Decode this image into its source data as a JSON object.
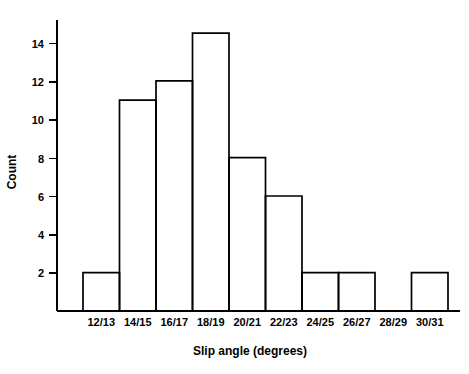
{
  "chart_data": {
    "type": "bar",
    "title": "",
    "xlabel": "Slip angle (degrees)",
    "ylabel": "Count",
    "categories": [
      "12/13",
      "14/15",
      "16/17",
      "18/19",
      "20/21",
      "22/23",
      "24/25",
      "26/27",
      "28/29",
      "30/31"
    ],
    "values": [
      2,
      11,
      12,
      14.5,
      8,
      6,
      2,
      2,
      0,
      2
    ],
    "ylim": [
      0,
      15.2
    ],
    "yticks": [
      2,
      4,
      6,
      8,
      10,
      12,
      14
    ],
    "ytick_labels": [
      "2",
      "4",
      "6",
      "8",
      "10",
      "12",
      "14"
    ],
    "grid": false,
    "legend": false,
    "bar_style": "outline",
    "bar_fill": "#ffffff",
    "bar_stroke": "#000000",
    "axis_color": "#000000"
  }
}
